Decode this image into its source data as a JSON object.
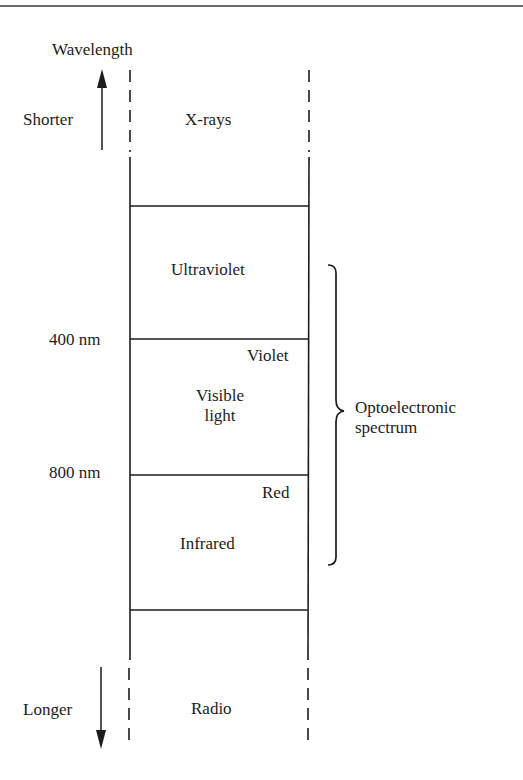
{
  "diagram": {
    "axis": {
      "title": "Wavelength",
      "shorter_label": "Shorter",
      "longer_label": "Longer"
    },
    "bands": [
      {
        "name": "X-rays",
        "boundary": "dashed-open-top"
      },
      {
        "name": "Ultraviolet"
      },
      {
        "name": "Visible light",
        "lines": [
          "Visible",
          "light"
        ],
        "top_edge_label": "Violet",
        "bottom_edge_label": "Red"
      },
      {
        "name": "Infrared"
      },
      {
        "name": "Radio",
        "boundary": "dashed-open-bottom"
      }
    ],
    "boundaries": [
      {
        "label": "400 nm"
      },
      {
        "label": "800 nm"
      }
    ],
    "brace": {
      "label_line1": "Optoelectronic",
      "label_line2": "spectrum",
      "spans": [
        "Ultraviolet",
        "Visible light",
        "Infrared"
      ]
    },
    "colors": {
      "ink": "#1c1c1c",
      "background": "#ffffff"
    }
  }
}
